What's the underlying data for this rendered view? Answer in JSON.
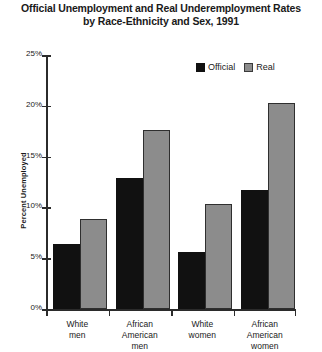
{
  "chart_data": {
    "type": "bar",
    "title": "Official Unemployment and Real Underemployment Rates by Race-Ethnicity and Sex, 1991",
    "title_lines": [
      "Official Unemployment and Real Underemployment Rates",
      "by Race-Ethnicity and Sex, 1991"
    ],
    "xlabel": "",
    "ylabel": "Percent Unemployed",
    "ylim": [
      0,
      25
    ],
    "ytick_labels": [
      "0%",
      "5%",
      "10%",
      "15%",
      "20%",
      "25%"
    ],
    "ytick_values": [
      0,
      5,
      10,
      15,
      20,
      25
    ],
    "grid": false,
    "legend_position": "top-right",
    "categories": [
      "White men",
      "African American men",
      "White women",
      "African American women"
    ],
    "category_lines": [
      [
        "White",
        "men"
      ],
      [
        "African",
        "American",
        "men"
      ],
      [
        "White",
        "women"
      ],
      [
        "African",
        "American",
        "women"
      ]
    ],
    "series": [
      {
        "name": "Official",
        "color": "#111111",
        "values": [
          6.4,
          12.9,
          5.6,
          11.7
        ]
      },
      {
        "name": "Real",
        "color": "#8c8c8c",
        "values": [
          8.9,
          17.6,
          10.3,
          20.3
        ]
      }
    ]
  },
  "legend": {
    "items": [
      {
        "label": "Official",
        "swatch": "black-square-icon"
      },
      {
        "label": "Real",
        "swatch": "gray-square-icon"
      }
    ]
  },
  "colors": {
    "official": "#111111",
    "real": "#8c8c8c",
    "axis": "#2b2b2b",
    "background": "#ffffff"
  }
}
